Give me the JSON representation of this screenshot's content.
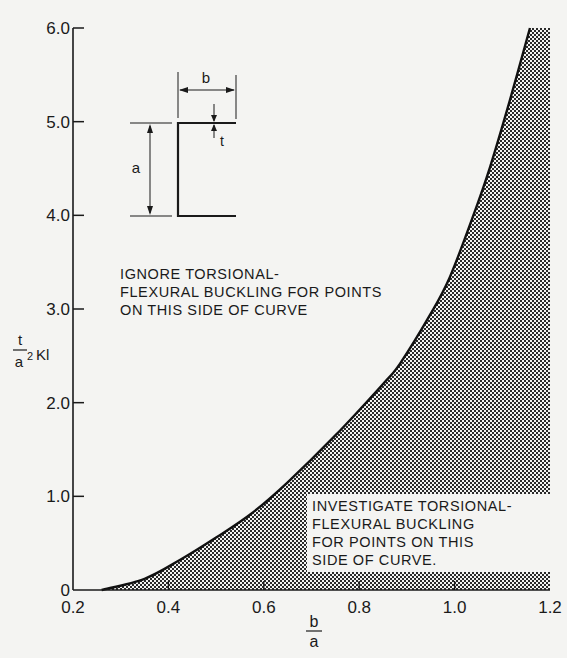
{
  "chart_data": {
    "type": "area",
    "title": "",
    "xlabel": "b/a",
    "ylabel": "t/a² · Kl",
    "xlabel_parts": {
      "numerator": "b",
      "denominator": "a"
    },
    "ylabel_parts": {
      "numerator": "t",
      "denominator": "a",
      "exponent": "2",
      "suffix": "Kl"
    },
    "xlim": [
      0.2,
      1.2
    ],
    "ylim": [
      0,
      6.0
    ],
    "xticks": [
      0.2,
      0.4,
      0.6,
      0.8,
      1.0,
      1.2
    ],
    "xtick_labels": [
      "0.2",
      "0.4",
      "0.6",
      "0.8",
      "1.0",
      "1.2"
    ],
    "yticks": [
      0,
      1.0,
      2.0,
      3.0,
      4.0,
      5.0,
      6.0
    ],
    "ytick_labels": [
      "0",
      "1.0",
      "2.0",
      "3.0",
      "4.0",
      "5.0",
      "6.0"
    ],
    "grid": false,
    "series": [
      {
        "name": "boundary curve",
        "x": [
          0.26,
          0.35,
          0.424,
          0.5,
          0.575,
          0.65,
          0.75,
          0.85,
          0.886,
          0.95,
          0.99,
          1.038,
          1.074,
          1.116,
          1.158
        ],
        "y": [
          0,
          0.12,
          0.32,
          0.56,
          0.82,
          1.15,
          1.65,
          2.2,
          2.42,
          2.95,
          3.34,
          3.98,
          4.51,
          5.23,
          6.0
        ],
        "fill": "shaded region to the right/below curve up to b/a = 1.2"
      }
    ],
    "annotations": [
      {
        "text": [
          "IGNORE TORSIONAL-",
          "FLEXURAL BUCKLING FOR POINTS",
          "ON THIS SIDE OF CURVE"
        ],
        "region": "upper-left (unshaded)"
      },
      {
        "text": [
          "INVESTIGATE TORSIONAL-",
          "FLEXURAL BUCKLING",
          "FOR POINTS ON THIS",
          "SIDE OF CURVE."
        ],
        "region": "lower-right (shaded)"
      }
    ],
    "inset": {
      "description": "Channel section sketch with dimensions",
      "labels": {
        "width": "b",
        "height": "a",
        "thickness": "t"
      }
    }
  },
  "labels": {
    "ignore_note": [
      "IGNORE TORSIONAL-",
      "FLEXURAL BUCKLING FOR POINTS",
      "ON THIS SIDE OF CURVE"
    ],
    "investigate_note": [
      "INVESTIGATE TORSIONAL-",
      "FLEXURAL BUCKLING",
      "FOR POINTS ON THIS",
      "SIDE OF CURVE."
    ],
    "inset_b": "b",
    "inset_a": "a",
    "inset_t": "t"
  },
  "colors": {
    "ink": "#1a1a1a",
    "paper": "#f4f4f2",
    "shade": "#8a8a8a"
  }
}
